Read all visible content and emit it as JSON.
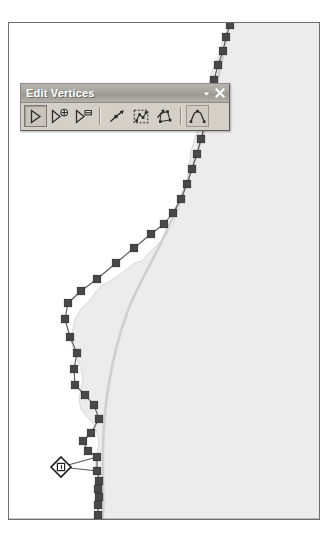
{
  "app": {
    "kind": "gis-map-editor",
    "canvas_label": "map-canvas"
  },
  "toolbar": {
    "title": "Edit Vertices",
    "titlebar_controls": [
      {
        "name": "toolbar-options-chevron",
        "icon": "chevron-down-icon",
        "label": "▾"
      },
      {
        "name": "toolbar-close",
        "icon": "close-icon",
        "label": "✕"
      }
    ],
    "buttons": [
      {
        "name": "modify-sketch-vertices",
        "icon": "arrow-cursor-icon",
        "label": "Modify Sketch Vertices",
        "state": "pressed"
      },
      {
        "name": "add-vertex",
        "icon": "arrow-plus-icon",
        "label": "Add Vertex",
        "state": "normal"
      },
      {
        "name": "delete-vertex",
        "icon": "arrow-minus-icon",
        "label": "Delete Vertex",
        "state": "normal"
      },
      {
        "name": "continue-feature",
        "icon": "continue-line-icon",
        "label": "Continue Feature",
        "state": "normal"
      },
      {
        "name": "select-vertices-box",
        "icon": "marquee-vertices-icon",
        "label": "Select Vertices With Box",
        "state": "normal"
      },
      {
        "name": "delete-selected-vertices",
        "icon": "delete-selected-vertices-icon",
        "label": "Delete Selected Vertices",
        "state": "normal"
      },
      {
        "name": "sketch-properties",
        "icon": "sketch-properties-icon",
        "label": "Sketch Properties",
        "state": "framed"
      }
    ]
  },
  "colors": {
    "frame_border": "#6e6e6e",
    "canvas_background": "#ffffff",
    "polygon_fill": "#ececec",
    "polygon_edge": "#d8d8d8",
    "reference_line": "#cfcfcf",
    "sketch_segment": "#595959",
    "vertex_fill": "#484848",
    "vertex_stroke": "#2b2b2b",
    "selected_vertex_outline": "#1e1e1e",
    "selected_vertex_fill": "#ffffff",
    "toolbar_face": "#d4d0c8",
    "toolbar_titlebar": "#a6a39c",
    "toolbar_title_text": "#ffffff"
  },
  "map": {
    "polygon_fill_region": {
      "name": "landmass-polygon",
      "path": "M 222,-1 L 214,16 L 210,32 L 203,48 L 199,64 L 196,80 L 191,96 L 187,112 L 182,128 L 180,145 L 178,160 L 173,176 L 168,190 L 163,203 L 156,214 L 148,222 L 140,230 L 133,238 L 126,240 L 118,246 L 110,252 L 101,258 L 92,263 L 86,270 L 80,278 L 72,286 L 66,296 L 64,306 L 62,316 L 64,326 L 68,336 L 72,346 L 74,356 L 72,366 L 70,376 L 72,386 L 78,394 L 84,400 L 88,410 L 90,420 L 88,430 L 86,440 L 88,450 L 92,458 L 96,466 L 96,476 L 95,486 L 94,496 L 94,498 L 312,498 L 312,-1 Z"
    },
    "reference_line": {
      "name": "original-geometry-line",
      "path": "M 218,12 C 212,46 202,86 190,124 C 178,162 164,196 150,224 C 138,248 126,268 118,290 C 110,312 104,336 100,360 C 96,384 94,406 94,430 C 94,454 94,476 94,498"
    },
    "bottom_edge_line": {
      "name": "map-bottom-feature-line",
      "y": 496
    },
    "sketch": {
      "name": "edited-sketch-polyline",
      "note": "vertex coordinates are relative to the map frame interior",
      "vertices": [
        {
          "x": 221,
          "y": 2,
          "selected": false
        },
        {
          "x": 217,
          "y": 14,
          "selected": false
        },
        {
          "x": 214,
          "y": 28,
          "selected": false
        },
        {
          "x": 209,
          "y": 42,
          "selected": false
        },
        {
          "x": 205,
          "y": 57,
          "selected": false
        },
        {
          "x": 202,
          "y": 72,
          "selected": false
        },
        {
          "x": 199,
          "y": 86,
          "selected": false
        },
        {
          "x": 196,
          "y": 101,
          "selected": false
        },
        {
          "x": 192,
          "y": 116,
          "selected": false
        },
        {
          "x": 188,
          "y": 131,
          "selected": false
        },
        {
          "x": 183,
          "y": 146,
          "selected": false
        },
        {
          "x": 178,
          "y": 161,
          "selected": false
        },
        {
          "x": 172,
          "y": 176,
          "selected": false
        },
        {
          "x": 164,
          "y": 190,
          "selected": false
        },
        {
          "x": 155,
          "y": 201,
          "selected": false
        },
        {
          "x": 142,
          "y": 211,
          "selected": false
        },
        {
          "x": 125,
          "y": 225,
          "selected": false
        },
        {
          "x": 107,
          "y": 240,
          "selected": false
        },
        {
          "x": 88,
          "y": 256,
          "selected": false
        },
        {
          "x": 72,
          "y": 268,
          "selected": false
        },
        {
          "x": 59,
          "y": 280,
          "selected": false
        },
        {
          "x": 56,
          "y": 296,
          "selected": false
        },
        {
          "x": 61,
          "y": 314,
          "selected": false
        },
        {
          "x": 68,
          "y": 330,
          "selected": false
        },
        {
          "x": 65,
          "y": 346,
          "selected": false
        },
        {
          "x": 66,
          "y": 362,
          "selected": false
        },
        {
          "x": 76,
          "y": 372,
          "selected": false
        },
        {
          "x": 85,
          "y": 382,
          "selected": false
        },
        {
          "x": 90,
          "y": 396,
          "selected": false
        },
        {
          "x": 82,
          "y": 410,
          "selected": false
        },
        {
          "x": 74,
          "y": 418,
          "selected": false
        },
        {
          "x": 79,
          "y": 428,
          "selected": false
        },
        {
          "x": 88,
          "y": 434,
          "selected": false
        },
        {
          "x": 52,
          "y": 444,
          "selected": true
        },
        {
          "x": 88,
          "y": 448,
          "selected": false
        },
        {
          "x": 90,
          "y": 458,
          "selected": false
        },
        {
          "x": 89,
          "y": 466,
          "selected": false
        },
        {
          "x": 90,
          "y": 474,
          "selected": false
        },
        {
          "x": 89,
          "y": 482,
          "selected": false
        },
        {
          "x": 89,
          "y": 492,
          "selected": false
        }
      ]
    }
  }
}
